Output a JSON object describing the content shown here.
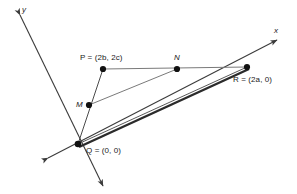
{
  "figure": {
    "background_color": "#ffffff",
    "line_color": "#3b3b3b",
    "thick_line_color": "#2b2b2b",
    "point_color": "#111111",
    "text_color": "#1a1a1a",
    "width": 297,
    "height": 194
  },
  "axes": {
    "x_label": "x",
    "y_label": "y",
    "x_axis": {
      "from": [
        48,
        158
      ],
      "to": [
        277,
        40
      ],
      "arrow_both_ends": true
    },
    "y_axis": {
      "from": [
        20,
        15
      ],
      "to": [
        103,
        186
      ],
      "arrow_both_ends": true
    }
  },
  "points": [
    {
      "id": "P",
      "label": "P = (2b, 2c)",
      "x": 103,
      "y": 69,
      "label_x": 80,
      "label_y": 54
    },
    {
      "id": "N",
      "label": "N",
      "x": 177,
      "y": 69,
      "label_x": 174,
      "label_y": 54
    },
    {
      "id": "R",
      "label": "R = (2a, 0)",
      "x": 247,
      "y": 67,
      "label_x": 233,
      "label_y": 76
    },
    {
      "id": "M",
      "label": "M",
      "x": 89,
      "y": 105,
      "label_x": 76,
      "label_y": 101
    },
    {
      "id": "Q",
      "label": "Q = (0, 0)",
      "x": 78,
      "y": 144,
      "label_x": 86,
      "label_y": 147
    }
  ],
  "segments": [
    {
      "id": "segment-PR",
      "from": "P",
      "to": "R",
      "weight": "thin"
    },
    {
      "id": "segment-QP",
      "from": "Q",
      "to": "P",
      "weight": "thin"
    },
    {
      "id": "segment-MN",
      "from": "M",
      "to": "N",
      "weight": "thin"
    },
    {
      "id": "segment-QR-thin",
      "from": "Q",
      "to": "R",
      "weight": "thin"
    },
    {
      "id": "segment-QR-thick",
      "from": "Q",
      "to": "R",
      "weight": "thick"
    }
  ]
}
